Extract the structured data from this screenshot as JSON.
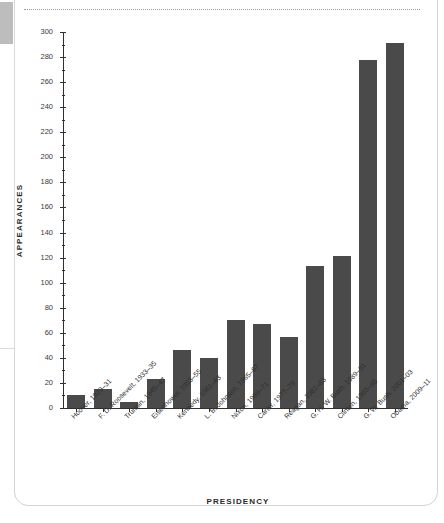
{
  "page": {
    "top_rule": "dotted-rule"
  },
  "chart_data": {
    "type": "bar",
    "title": "",
    "xlabel": "PRESIDENCY",
    "ylabel": "APPEARANCES",
    "ylim": [
      0,
      300
    ],
    "ytick_step": 20,
    "yminor_step": 10,
    "grid": false,
    "legend": "none",
    "bar_color": "#4a4a4a",
    "categories": [
      "Hoover, 1929–31",
      "F. D. Roosevelt, 1933–35",
      "Truman, 1945–47",
      "Eisenhower, 1953–55",
      "Kennedy, 1961–63",
      "L. B. Johnson, 1965–67",
      "Nixon, 1969–71",
      "Carter, 1977–79",
      "Reagan, 1981–83",
      "G. H. W. Bush, 1989–91",
      "Clinton, 1993–95",
      "G. W. Bush, 2001–03",
      "Obama, 2009–11"
    ],
    "values": [
      10,
      15,
      5,
      23,
      46,
      40,
      70,
      67,
      57,
      113,
      121,
      278,
      291
    ],
    "ytick_labels": [
      "0",
      "20",
      "40",
      "60",
      "80",
      "100",
      "120",
      "140",
      "160",
      "180",
      "200",
      "220",
      "240",
      "260",
      "280",
      "300"
    ]
  }
}
